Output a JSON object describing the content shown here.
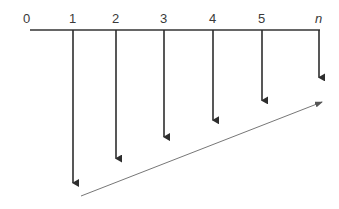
{
  "diagram": {
    "type": "cash-flow-diagram",
    "timeline_labels": [
      "0",
      "1",
      "2",
      "3",
      "4",
      "5",
      "n"
    ],
    "periods": [
      {
        "label": "1",
        "relative_magnitude": 1.0
      },
      {
        "label": "2",
        "relative_magnitude": 0.84
      },
      {
        "label": "3",
        "relative_magnitude": 0.7
      },
      {
        "label": "4",
        "relative_magnitude": 0.59
      },
      {
        "label": "5",
        "relative_magnitude": 0.46
      },
      {
        "label": "n",
        "relative_magnitude": 0.31
      }
    ],
    "trend_arrow": "increasing-right",
    "colors": {
      "axis": "#333333",
      "arrows": "#2e2e2e",
      "trend": "#777777",
      "text": "#3a3a3a"
    }
  }
}
